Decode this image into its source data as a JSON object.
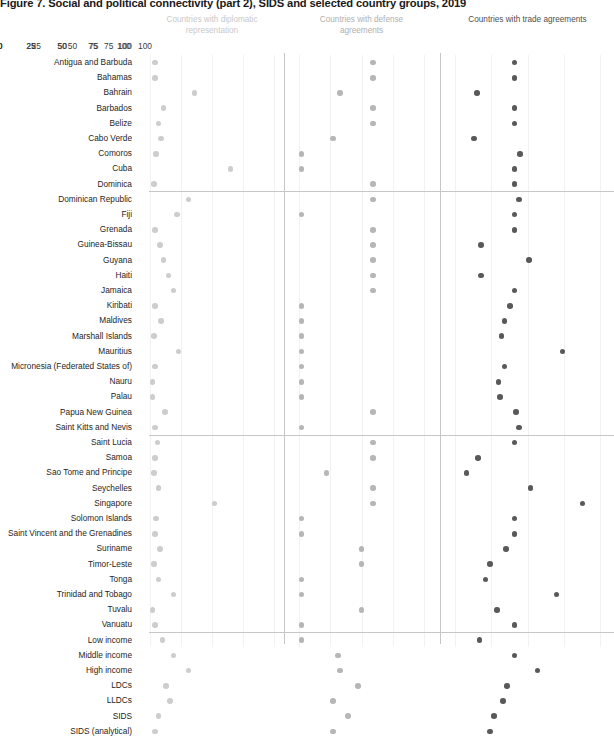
{
  "title": "Figure 7. Social and political connectivity (part 2), SIDS and selected country groups, 2019",
  "panels": [
    {
      "id": "diplomatic",
      "label": "Countries with diplomatic representation",
      "color": "#cdcdcd"
    },
    {
      "id": "defense",
      "label": "Countries with defense agreements",
      "color": "#b6b6b6"
    },
    {
      "id": "trade",
      "label": "Countries with trade agreements",
      "color": "#595959"
    }
  ],
  "ticks": [
    "0",
    "25",
    "50",
    "75",
    "100"
  ],
  "axis": {
    "min": 0,
    "max": 100
  },
  "group_breaks_after": [
    "Dominica",
    "Saint Kitts and Nevis",
    "Vanuatu"
  ],
  "chart_data": {
    "type": "scatter",
    "title": "Figure 7. Social and political connectivity (part 2), SIDS and selected country groups, 2019",
    "xlabel": "",
    "ylabel": "",
    "xlim": [
      0,
      100
    ],
    "grid": true,
    "legend": "none",
    "categories": [
      "Antigua and Barbuda",
      "Bahamas",
      "Bahrain",
      "Barbados",
      "Belize",
      "Cabo Verde",
      "Comoros",
      "Cuba",
      "Dominica",
      "Dominican Republic",
      "Fiji",
      "Grenada",
      "Guinea-Bissau",
      "Guyana",
      "Haiti",
      "Jamaica",
      "Kiribati",
      "Maldives",
      "Marshall Islands",
      "Mauritius",
      "Micronesia (Federated States of)",
      "Nauru",
      "Palau",
      "Papua New Guinea",
      "Saint Kitts and Nevis",
      "Saint Lucia",
      "Samoa",
      "Sao Tome and Principe",
      "Seychelles",
      "Singapore",
      "Solomon Islands",
      "Saint Vincent and the Grenadines",
      "Suriname",
      "Timor-Leste",
      "Tonga",
      "Trinidad and Tobago",
      "Tuvalu",
      "Vanuatu",
      "Low income",
      "Middle income",
      "High income",
      "LDCs",
      "LLDCs",
      "SIDS",
      "SIDS (analytical)"
    ],
    "series": [
      {
        "name": "Countries with diplomatic representation",
        "color": "#cdcdcd",
        "values": [
          4,
          4,
          36,
          11,
          7,
          9,
          5,
          65,
          3,
          31,
          22,
          4,
          8,
          11,
          15,
          19,
          4,
          9,
          3,
          23,
          4,
          2,
          2,
          12,
          4,
          6,
          4,
          3,
          7,
          52,
          5,
          4,
          8,
          3,
          7,
          19,
          2,
          4,
          10,
          19,
          31,
          13,
          16,
          7,
          4
        ]
      },
      {
        "name": "Countries with defense agreements",
        "color": "#b6b6b6",
        "values": [
          59,
          59,
          33,
          59,
          59,
          27,
          2,
          2,
          59,
          59,
          2,
          59,
          59,
          59,
          59,
          59,
          2,
          2,
          2,
          2,
          2,
          2,
          2,
          59,
          2,
          59,
          59,
          22,
          59,
          59,
          2,
          2,
          50,
          50,
          2,
          2,
          50,
          2,
          2,
          31,
          33,
          47,
          27,
          39,
          27
        ]
      },
      {
        "name": "Countries with trade agreements",
        "color": "#595959",
        "values": [
          41,
          41,
          15,
          41,
          41,
          13,
          45,
          41,
          41,
          44,
          41,
          41,
          18,
          51,
          18,
          41,
          38,
          34,
          32,
          74,
          34,
          30,
          31,
          42,
          44,
          41,
          16,
          8,
          52,
          88,
          41,
          41,
          35,
          24,
          21,
          70,
          29,
          41,
          17,
          41,
          57,
          36,
          33,
          27,
          24
        ]
      }
    ]
  }
}
